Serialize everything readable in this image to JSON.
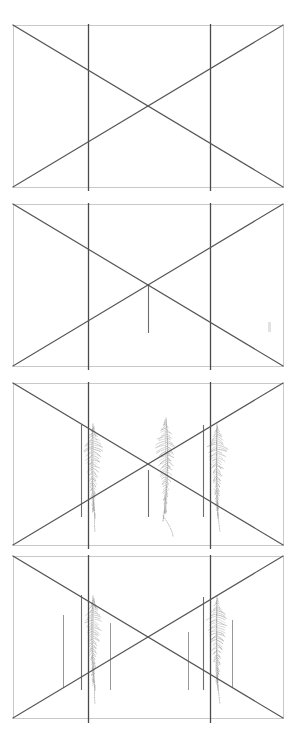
{
  "figure": {
    "title": "",
    "background_color": "#ffffff",
    "width": 296,
    "height": 735,
    "panel_count": 4
  },
  "style": {
    "frame_color": "#c9c9c9",
    "diagonal_color": "#555555",
    "vertical_strong_color": "#4a4a4a",
    "vertical_medium_color": "#6e6e6e",
    "vertical_light_color": "#8c8c8c",
    "plant_color": "#9a9a9a",
    "artifact_color": "#d8d8d8",
    "frame_width": 1,
    "diagonal_width": 1.2,
    "vertical_width": 1.3
  },
  "chart_data": {
    "type": "diagram",
    "title": "",
    "xlabel": "",
    "ylabel": "",
    "panels": [
      {
        "index": 1,
        "label": "Panel 1 — empty perspective frame",
        "frame": {
          "x": 13,
          "y": 25,
          "width": 270,
          "height": 162
        },
        "diagonals": [
          {
            "name": "diagonal-down",
            "x1": 13,
            "y1": 25,
            "x2": 283,
            "y2": 187
          },
          {
            "name": "diagonal-up",
            "x1": 13,
            "y1": 187,
            "x2": 283,
            "y2": 25
          }
        ],
        "verticals": [
          {
            "name": "left-post",
            "x": 88,
            "y1": 24,
            "y2": 191,
            "weight": "strong"
          },
          {
            "name": "right-post",
            "x": 210,
            "y1": 24,
            "y2": 191,
            "weight": "strong"
          }
        ],
        "plants": [],
        "artifacts": []
      },
      {
        "index": 2,
        "label": "Panel 2 — centre stem added",
        "frame": {
          "x": 13,
          "y": 204,
          "width": 270,
          "height": 162
        },
        "diagonals": [
          {
            "name": "diagonal-down",
            "x1": 13,
            "y1": 204,
            "x2": 283,
            "y2": 366
          },
          {
            "name": "diagonal-up",
            "x1": 13,
            "y1": 366,
            "x2": 283,
            "y2": 204
          }
        ],
        "verticals": [
          {
            "name": "left-post",
            "x": 88,
            "y1": 203,
            "y2": 370,
            "weight": "strong"
          },
          {
            "name": "right-post",
            "x": 210,
            "y1": 203,
            "y2": 370,
            "weight": "strong"
          },
          {
            "name": "centre-stem",
            "x": 148,
            "y1": 285,
            "y2": 333,
            "weight": "medium"
          }
        ],
        "plants": [],
        "artifacts": [
          {
            "name": "speck-right",
            "x": 268,
            "y": 322,
            "width": 3,
            "height": 10
          }
        ]
      },
      {
        "index": 3,
        "label": "Panel 3 — three plants with supporting posts",
        "frame": {
          "x": 13,
          "y": 383,
          "width": 270,
          "height": 162
        },
        "diagonals": [
          {
            "name": "diagonal-down",
            "x1": 13,
            "y1": 383,
            "x2": 283,
            "y2": 545
          },
          {
            "name": "diagonal-up",
            "x1": 13,
            "y1": 545,
            "x2": 283,
            "y2": 383
          }
        ],
        "verticals": [
          {
            "name": "left-post",
            "x": 88,
            "y1": 382,
            "y2": 549,
            "weight": "strong"
          },
          {
            "name": "right-post",
            "x": 210,
            "y1": 382,
            "y2": 549,
            "weight": "strong"
          },
          {
            "name": "left-brace",
            "x": 81,
            "y1": 425,
            "y2": 517,
            "weight": "medium"
          },
          {
            "name": "centre-brace",
            "x": 148,
            "y1": 470,
            "y2": 517,
            "weight": "medium"
          },
          {
            "name": "right-brace",
            "x": 203,
            "y1": 425,
            "y2": 517,
            "weight": "medium"
          }
        ],
        "plants": [
          {
            "name": "plant-left",
            "base_x": 95,
            "base_y": 518,
            "tip_y": 424,
            "spread": 9,
            "lean": -2
          },
          {
            "name": "plant-centre",
            "base_x": 163,
            "base_y": 521,
            "tip_y": 418,
            "spread": 10,
            "lean": 3
          },
          {
            "name": "plant-right",
            "base_x": 218,
            "base_y": 518,
            "tip_y": 424,
            "spread": 10,
            "lean": -1
          }
        ],
        "artifacts": []
      },
      {
        "index": 4,
        "label": "Panel 4 — plants plus outer post clusters",
        "frame": {
          "x": 13,
          "y": 556,
          "width": 270,
          "height": 162
        },
        "diagonals": [
          {
            "name": "diagonal-down",
            "x1": 13,
            "y1": 556,
            "x2": 283,
            "y2": 718
          },
          {
            "name": "diagonal-up",
            "x1": 13,
            "y1": 718,
            "x2": 283,
            "y2": 556
          }
        ],
        "verticals": [
          {
            "name": "left-post",
            "x": 88,
            "y1": 555,
            "y2": 723,
            "weight": "strong"
          },
          {
            "name": "right-post",
            "x": 210,
            "y1": 555,
            "y2": 723,
            "weight": "strong"
          },
          {
            "name": "left-outer-post",
            "x": 63,
            "y1": 615,
            "y2": 688,
            "weight": "light"
          },
          {
            "name": "left-brace",
            "x": 81,
            "y1": 595,
            "y2": 690,
            "weight": "medium"
          },
          {
            "name": "left-inner-post",
            "x": 110,
            "y1": 623,
            "y2": 690,
            "weight": "light"
          },
          {
            "name": "right-inner-post",
            "x": 188,
            "y1": 632,
            "y2": 690,
            "weight": "light"
          },
          {
            "name": "right-brace",
            "x": 203,
            "y1": 597,
            "y2": 690,
            "weight": "medium"
          },
          {
            "name": "right-outer-post",
            "x": 232,
            "y1": 620,
            "y2": 688,
            "weight": "light"
          }
        ],
        "plants": [
          {
            "name": "plant-left",
            "base_x": 95,
            "base_y": 690,
            "tip_y": 596,
            "spread": 9,
            "lean": -2
          },
          {
            "name": "plant-right",
            "base_x": 218,
            "base_y": 690,
            "tip_y": 596,
            "spread": 10,
            "lean": -1
          }
        ],
        "artifacts": []
      }
    ]
  }
}
